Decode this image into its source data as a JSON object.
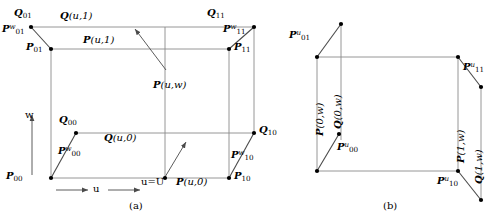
{
  "figure": {
    "panels": [
      {
        "id": "a",
        "caption": "(a)",
        "corner_labels": [
          {
            "name": "Q01",
            "base": "Q",
            "sub": "01",
            "sup": ""
          },
          {
            "name": "Q11",
            "base": "Q",
            "sub": "11",
            "sup": ""
          },
          {
            "name": "Q00",
            "base": "Q",
            "sub": "00",
            "sup": ""
          },
          {
            "name": "Q10",
            "base": "Q",
            "sub": "10",
            "sup": ""
          },
          {
            "name": "P01",
            "base": "P",
            "sub": "01",
            "sup": ""
          },
          {
            "name": "P11",
            "base": "P",
            "sub": "11",
            "sup": ""
          },
          {
            "name": "P00",
            "base": "P",
            "sub": "00",
            "sup": ""
          },
          {
            "name": "P10",
            "base": "P",
            "sub": "10",
            "sup": ""
          },
          {
            "name": "Pw01",
            "base": "P",
            "sub": "01",
            "sup": "w"
          },
          {
            "name": "Pw11",
            "base": "P",
            "sub": "11",
            "sup": "w"
          },
          {
            "name": "Pw00",
            "base": "P",
            "sub": "00",
            "sup": "w"
          },
          {
            "name": "Pw10",
            "base": "P",
            "sub": "10",
            "sup": "w"
          }
        ],
        "curve_labels": [
          {
            "name": "Qu1",
            "text": "Q(u,1)"
          },
          {
            "name": "Pu1",
            "text": "P(u,1)"
          },
          {
            "name": "Puw",
            "text": "P(u,w)"
          },
          {
            "name": "Qu0",
            "text": "Q(u,0)"
          },
          {
            "name": "Pu0",
            "text": "P(u,0)"
          }
        ],
        "axis_labels": [
          {
            "name": "w-axis",
            "text": "w"
          },
          {
            "name": "u-axis",
            "text": "u"
          },
          {
            "name": "u-equals-U",
            "text": "u=U"
          }
        ]
      },
      {
        "id": "b",
        "caption": "(b)",
        "corner_labels": [
          {
            "name": "Pu01",
            "base": "P",
            "sub": "01",
            "sup": "u"
          },
          {
            "name": "Pu11",
            "base": "P",
            "sub": "11",
            "sup": "u"
          },
          {
            "name": "Pu00",
            "base": "P",
            "sub": "00",
            "sup": "u"
          },
          {
            "name": "Pu10",
            "base": "P",
            "sub": "10",
            "sup": "u"
          }
        ],
        "curve_labels": [
          {
            "name": "P0w",
            "text": "P(0,w)"
          },
          {
            "name": "Q0w",
            "text": "Q(0,w)"
          },
          {
            "name": "P1w",
            "text": "P(1,w)"
          },
          {
            "name": "Q1w",
            "text": "Q(1,w)"
          }
        ]
      }
    ],
    "colors": {
      "line": "#808080",
      "tangent": "#404040",
      "dot": "#000000",
      "text": "#000000",
      "background": "#ffffff"
    }
  },
  "labels": {
    "a": {
      "Q01": {
        "base": "Q",
        "sub": "01"
      },
      "Q11": {
        "base": "Q",
        "sub": "11"
      },
      "Q00": {
        "base": "Q",
        "sub": "00"
      },
      "Q10": {
        "base": "Q",
        "sub": "10"
      },
      "P01": {
        "base": "P",
        "sub": "01"
      },
      "P11": {
        "base": "P",
        "sub": "11"
      },
      "P00": {
        "base": "P",
        "sub": "00"
      },
      "P10": {
        "base": "P",
        "sub": "10"
      },
      "Pw01": {
        "base": "P",
        "sup": "w",
        "sub": "01"
      },
      "Pw11": {
        "base": "P",
        "sup": "w",
        "sub": "11"
      },
      "Pw00": {
        "base": "P",
        "sup": "w",
        "sub": "00"
      },
      "Pw10": {
        "base": "P",
        "sup": "w",
        "sub": "10"
      },
      "Qu1": "Q(u,1)",
      "Pu1": "P(u,1)",
      "Puw": "P(u,w)",
      "Qu0": "Q(u,0)",
      "Pu0": "P(u,0)",
      "w_axis": "w",
      "u_axis": "u",
      "u_eq_U": "u=U",
      "caption": "(a)"
    },
    "b": {
      "Pu01": {
        "base": "P",
        "sup": "u",
        "sub": "01"
      },
      "Pu11": {
        "base": "P",
        "sup": "u",
        "sub": "11"
      },
      "Pu00": {
        "base": "P",
        "sup": "u",
        "sub": "00"
      },
      "Pu10": {
        "base": "P",
        "sup": "u",
        "sub": "10"
      },
      "P0w": "P(0,w)",
      "Q0w": "Q(0,w)",
      "P1w": "P(1,w)",
      "Q1w": "Q(1,w)",
      "caption": "(b)"
    }
  }
}
